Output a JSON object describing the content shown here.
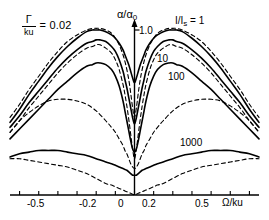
{
  "figure": {
    "gamma_label": {
      "numerator": "Γ",
      "denominator": "ku",
      "equals_value": "= 0.02"
    },
    "y_axis": {
      "title_main": "α/α",
      "title_sub": "0",
      "tick_label": "1.0"
    },
    "x_axis": {
      "title": "Ω/ku",
      "ticks": [
        "-0.5",
        "-0.2",
        "0",
        "0.2",
        "0.5"
      ]
    },
    "curve_labels": {
      "first_main": "I/I",
      "first_sub": "s",
      "first_eq": " = 1",
      "second": "10",
      "third": "100",
      "fourth": "1000"
    }
  },
  "chart_data": {
    "type": "line",
    "title": "",
    "xlabel": "Ω/ku",
    "ylabel": "α/α_0",
    "xlim": [
      -0.65,
      0.65
    ],
    "ylim": [
      0,
      1.15
    ],
    "xticks": [
      -0.5,
      -0.4,
      -0.3,
      -0.2,
      -0.1,
      0,
      0.1,
      0.2,
      0.3,
      0.4,
      0.5
    ],
    "xticklabels": [
      "-0.5",
      "",
      "",
      "-0.2",
      "",
      "0",
      "",
      "0.2",
      "",
      "",
      "0.5"
    ],
    "yticks": [
      1.0
    ],
    "yticklabels": [
      "1.0"
    ],
    "grid": false,
    "legend": "inline-annotations",
    "annotations": [
      {
        "text": "Γ/ku = 0.02",
        "x": -0.45,
        "y": 1.07
      },
      {
        "text": "I/I_s = 1",
        "x": 0.22,
        "y": 1.06
      },
      {
        "text": "10",
        "x": 0.13,
        "y": 0.79
      },
      {
        "text": "100",
        "x": 0.18,
        "y": 0.7
      },
      {
        "text": "1000",
        "x": 0.25,
        "y": 0.32
      }
    ],
    "parameters": {
      "Gamma_over_ku": 0.02,
      "saturation_values": [
        1,
        10,
        100,
        1000
      ]
    },
    "series": [
      {
        "name": "I/Is = 1 (solid, with Lamb dip)",
        "style": "solid",
        "x": [
          -0.65,
          -0.6,
          -0.55,
          -0.5,
          -0.45,
          -0.4,
          -0.35,
          -0.3,
          -0.25,
          -0.22,
          -0.2,
          -0.18,
          -0.15,
          -0.12,
          -0.1,
          -0.08,
          -0.06,
          -0.05,
          -0.04,
          -0.03,
          -0.02,
          -0.01,
          0.0,
          0.01,
          0.02,
          0.03,
          0.04,
          0.05,
          0.06,
          0.08,
          0.1,
          0.12,
          0.15,
          0.18,
          0.2,
          0.22,
          0.25,
          0.3,
          0.35,
          0.4,
          0.45,
          0.5,
          0.55,
          0.6,
          0.65
        ],
        "y": [
          0.44,
          0.52,
          0.61,
          0.69,
          0.77,
          0.84,
          0.9,
          0.95,
          0.99,
          1.0,
          1.0,
          1.0,
          0.99,
          0.97,
          0.95,
          0.92,
          0.88,
          0.85,
          0.82,
          0.79,
          0.75,
          0.71,
          0.68,
          0.71,
          0.75,
          0.79,
          0.82,
          0.85,
          0.88,
          0.92,
          0.95,
          0.97,
          0.99,
          1.0,
          1.0,
          1.0,
          0.99,
          0.95,
          0.9,
          0.84,
          0.77,
          0.69,
          0.61,
          0.52,
          0.44
        ]
      },
      {
        "name": "I/Is = 10 (solid)",
        "style": "solid",
        "x": [
          -0.65,
          -0.6,
          -0.55,
          -0.5,
          -0.45,
          -0.4,
          -0.35,
          -0.3,
          -0.25,
          -0.22,
          -0.2,
          -0.18,
          -0.15,
          -0.12,
          -0.1,
          -0.08,
          -0.06,
          -0.05,
          -0.04,
          -0.03,
          -0.02,
          -0.01,
          0.0,
          0.01,
          0.02,
          0.03,
          0.04,
          0.05,
          0.06,
          0.08,
          0.1,
          0.12,
          0.15,
          0.18,
          0.2,
          0.22,
          0.25,
          0.3,
          0.35,
          0.4,
          0.45,
          0.5,
          0.55,
          0.6,
          0.65
        ],
        "y": [
          0.41,
          0.48,
          0.56,
          0.63,
          0.7,
          0.77,
          0.83,
          0.88,
          0.92,
          0.93,
          0.94,
          0.94,
          0.93,
          0.9,
          0.87,
          0.82,
          0.75,
          0.7,
          0.65,
          0.59,
          0.53,
          0.47,
          0.43,
          0.47,
          0.53,
          0.59,
          0.65,
          0.7,
          0.75,
          0.82,
          0.87,
          0.9,
          0.93,
          0.94,
          0.94,
          0.93,
          0.92,
          0.88,
          0.83,
          0.77,
          0.7,
          0.63,
          0.56,
          0.48,
          0.41
        ]
      },
      {
        "name": "I/Is = 100 (solid)",
        "style": "solid",
        "x": [
          -0.65,
          -0.6,
          -0.55,
          -0.5,
          -0.45,
          -0.4,
          -0.35,
          -0.3,
          -0.25,
          -0.22,
          -0.2,
          -0.18,
          -0.15,
          -0.12,
          -0.1,
          -0.08,
          -0.06,
          -0.05,
          -0.04,
          -0.03,
          -0.02,
          -0.01,
          0.0,
          0.01,
          0.02,
          0.03,
          0.04,
          0.05,
          0.06,
          0.08,
          0.1,
          0.12,
          0.15,
          0.18,
          0.2,
          0.22,
          0.25,
          0.3,
          0.35,
          0.4,
          0.45,
          0.5,
          0.55,
          0.6,
          0.65
        ],
        "y": [
          0.34,
          0.4,
          0.46,
          0.52,
          0.58,
          0.64,
          0.69,
          0.74,
          0.78,
          0.79,
          0.8,
          0.8,
          0.79,
          0.76,
          0.72,
          0.66,
          0.57,
          0.51,
          0.45,
          0.39,
          0.33,
          0.28,
          0.26,
          0.28,
          0.33,
          0.39,
          0.45,
          0.51,
          0.57,
          0.66,
          0.72,
          0.76,
          0.79,
          0.8,
          0.8,
          0.79,
          0.78,
          0.74,
          0.69,
          0.64,
          0.58,
          0.52,
          0.46,
          0.4,
          0.34
        ]
      },
      {
        "name": "I/Is = 1000 (solid)",
        "style": "solid",
        "x": [
          -0.65,
          -0.6,
          -0.55,
          -0.5,
          -0.45,
          -0.4,
          -0.35,
          -0.3,
          -0.25,
          -0.2,
          -0.15,
          -0.12,
          -0.1,
          -0.08,
          -0.06,
          -0.04,
          -0.03,
          -0.02,
          -0.01,
          0.0,
          0.01,
          0.02,
          0.03,
          0.04,
          0.06,
          0.08,
          0.1,
          0.12,
          0.15,
          0.2,
          0.25,
          0.3,
          0.35,
          0.4,
          0.45,
          0.5,
          0.55,
          0.6,
          0.65
        ],
        "y": [
          0.23,
          0.25,
          0.26,
          0.27,
          0.27,
          0.27,
          0.26,
          0.25,
          0.24,
          0.22,
          0.2,
          0.19,
          0.18,
          0.17,
          0.16,
          0.15,
          0.14,
          0.13,
          0.12,
          0.12,
          0.12,
          0.13,
          0.14,
          0.15,
          0.16,
          0.17,
          0.18,
          0.19,
          0.2,
          0.22,
          0.24,
          0.25,
          0.26,
          0.27,
          0.27,
          0.27,
          0.26,
          0.25,
          0.23
        ]
      },
      {
        "name": "I/Is = 1 (dashed, Doppler-limited)",
        "style": "dashed",
        "x": [
          -0.65,
          -0.6,
          -0.55,
          -0.5,
          -0.45,
          -0.4,
          -0.35,
          -0.3,
          -0.25,
          -0.22,
          -0.2,
          -0.18,
          -0.15,
          -0.12,
          -0.1,
          -0.08,
          -0.06,
          -0.05,
          -0.04,
          -0.03,
          -0.02,
          -0.01,
          0.0,
          0.01,
          0.02,
          0.03,
          0.04,
          0.05,
          0.06,
          0.08,
          0.1,
          0.12,
          0.15,
          0.18,
          0.2,
          0.22,
          0.25,
          0.3,
          0.35,
          0.4,
          0.45,
          0.5,
          0.55,
          0.6,
          0.65
        ],
        "y": [
          0.47,
          0.55,
          0.64,
          0.72,
          0.8,
          0.87,
          0.93,
          0.97,
          1.0,
          1.01,
          1.01,
          1.01,
          1.0,
          0.98,
          0.95,
          0.91,
          0.85,
          0.81,
          0.76,
          0.7,
          0.62,
          0.53,
          0.47,
          0.53,
          0.62,
          0.7,
          0.76,
          0.81,
          0.85,
          0.91,
          0.95,
          0.98,
          1.0,
          1.01,
          1.01,
          1.01,
          1.0,
          0.97,
          0.93,
          0.87,
          0.8,
          0.72,
          0.64,
          0.55,
          0.47
        ]
      },
      {
        "name": "I/Is = 10 (dashed)",
        "style": "dashed",
        "x": [
          -0.65,
          -0.6,
          -0.55,
          -0.5,
          -0.45,
          -0.4,
          -0.35,
          -0.3,
          -0.25,
          -0.22,
          -0.2,
          -0.18,
          -0.15,
          -0.12,
          -0.1,
          -0.08,
          -0.06,
          -0.05,
          -0.04,
          -0.03,
          -0.02,
          -0.01,
          0.0,
          0.01,
          0.02,
          0.03,
          0.04,
          0.05,
          0.06,
          0.08,
          0.1,
          0.12,
          0.15,
          0.18,
          0.2,
          0.22,
          0.25,
          0.3,
          0.35,
          0.4,
          0.45,
          0.5,
          0.55,
          0.6,
          0.65
        ],
        "y": [
          0.38,
          0.45,
          0.53,
          0.6,
          0.67,
          0.74,
          0.8,
          0.85,
          0.89,
          0.9,
          0.91,
          0.91,
          0.89,
          0.86,
          0.82,
          0.76,
          0.67,
          0.61,
          0.54,
          0.46,
          0.37,
          0.28,
          0.22,
          0.28,
          0.37,
          0.46,
          0.54,
          0.61,
          0.67,
          0.76,
          0.82,
          0.86,
          0.89,
          0.91,
          0.91,
          0.9,
          0.89,
          0.85,
          0.8,
          0.74,
          0.67,
          0.6,
          0.53,
          0.45,
          0.38
        ]
      },
      {
        "name": "I/Is = 100 (dashed, broad)",
        "style": "dashed",
        "x": [
          -0.65,
          -0.6,
          -0.55,
          -0.5,
          -0.45,
          -0.4,
          -0.35,
          -0.3,
          -0.25,
          -0.2,
          -0.15,
          -0.12,
          -0.1,
          -0.08,
          -0.06,
          -0.05,
          -0.04,
          -0.03,
          -0.02,
          -0.01,
          0.0,
          0.01,
          0.02,
          0.03,
          0.04,
          0.05,
          0.06,
          0.08,
          0.1,
          0.12,
          0.15,
          0.2,
          0.25,
          0.3,
          0.35,
          0.4,
          0.45,
          0.5,
          0.55,
          0.6,
          0.65
        ],
        "y": [
          0.38,
          0.45,
          0.5,
          0.54,
          0.57,
          0.58,
          0.58,
          0.57,
          0.55,
          0.51,
          0.45,
          0.41,
          0.38,
          0.34,
          0.3,
          0.27,
          0.25,
          0.22,
          0.19,
          0.17,
          0.16,
          0.17,
          0.19,
          0.22,
          0.25,
          0.27,
          0.3,
          0.34,
          0.38,
          0.41,
          0.45,
          0.51,
          0.55,
          0.57,
          0.58,
          0.58,
          0.57,
          0.54,
          0.5,
          0.45,
          0.38
        ]
      },
      {
        "name": "I/Is = 1000 (dashed, broadest)",
        "style": "dashed",
        "x": [
          -0.65,
          -0.6,
          -0.55,
          -0.5,
          -0.45,
          -0.4,
          -0.35,
          -0.3,
          -0.25,
          -0.2,
          -0.15,
          -0.12,
          -0.1,
          -0.08,
          -0.06,
          -0.05,
          -0.04,
          -0.03,
          -0.02,
          -0.01,
          0.0,
          0.01,
          0.02,
          0.03,
          0.04,
          0.05,
          0.06,
          0.08,
          0.1,
          0.12,
          0.15,
          0.2,
          0.25,
          0.3,
          0.35,
          0.4,
          0.45,
          0.5,
          0.55,
          0.6,
          0.65
        ],
        "y": [
          0.22,
          0.22,
          0.21,
          0.2,
          0.19,
          0.18,
          0.17,
          0.15,
          0.13,
          0.1,
          0.07,
          0.06,
          0.05,
          0.04,
          0.03,
          0.025,
          0.02,
          0.015,
          0.01,
          0.005,
          0.0,
          0.005,
          0.01,
          0.015,
          0.02,
          0.025,
          0.03,
          0.04,
          0.05,
          0.06,
          0.07,
          0.1,
          0.13,
          0.15,
          0.17,
          0.18,
          0.19,
          0.2,
          0.21,
          0.22,
          0.22
        ]
      }
    ]
  }
}
